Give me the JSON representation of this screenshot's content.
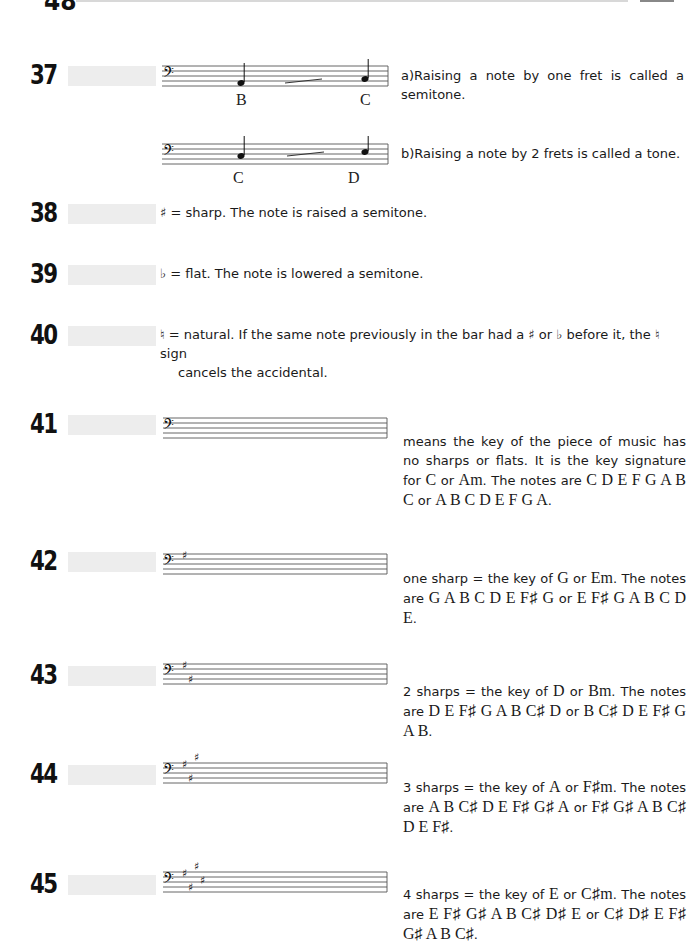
{
  "header": {
    "page_number_partial": "48"
  },
  "sections": [
    {
      "number": "37",
      "examples": [
        {
          "notes": [
            "B",
            "C"
          ],
          "text": "a)Raising a note by one fret is called a semitone."
        },
        {
          "notes": [
            "C",
            "D"
          ],
          "text": "b)Raising a note by 2 frets is called a tone."
        }
      ]
    },
    {
      "number": "38",
      "symbol": "♯",
      "text": " = sharp. The note is raised a semitone."
    },
    {
      "number": "39",
      "symbol": "♭",
      "text": " = flat. The note is lowered a semitone."
    },
    {
      "number": "40",
      "symbol": "♮",
      "text_line1": " = natural. If the same note previously in the bar had a ♯ or ♭ before it, the ♮ sign",
      "text_line2": "cancels the accidental."
    },
    {
      "number": "41",
      "sharps": 0,
      "text_a": "means the key of the piece of music has no sharps or flats. It is the key signature for ",
      "key": "C",
      "text_b": " or ",
      "minor": "Am",
      "text_c": ". The notes are ",
      "notes_major": "C D E F G A B C",
      "text_d": " or ",
      "notes_minor": "A B C D E F G A",
      "text_e": "."
    },
    {
      "number": "42",
      "sharps": 1,
      "text_a": "one sharp = the key of ",
      "key": "G",
      "text_b": " or ",
      "minor": "Em",
      "text_c": ". The notes are ",
      "notes_major": "G A B C D E F♯ G",
      "text_d": " or ",
      "notes_minor": "E F♯ G A B C D E",
      "text_e": "."
    },
    {
      "number": "43",
      "sharps": 2,
      "text_a": "2 sharps = the key of ",
      "key": "D",
      "text_b": " or ",
      "minor": "Bm",
      "text_c": ". The notes are ",
      "notes_major": "D E F♯ G A B C♯ D",
      "text_d": " or ",
      "notes_minor": "B C♯ D E F♯ G A B",
      "text_e": "."
    },
    {
      "number": "44",
      "sharps": 3,
      "text_a": "3 sharps = the key of ",
      "key": "A",
      "text_b": " or ",
      "minor": "F♯m",
      "text_c": ". The notes are ",
      "notes_major": "A B C♯ D E F♯ G♯ A",
      "text_d": " or ",
      "notes_minor": "F♯ G♯ A B C♯ D E F♯",
      "text_e": "."
    },
    {
      "number": "45",
      "sharps": 4,
      "text_a": "4 sharps = the key of ",
      "key": "E",
      "text_b": " or ",
      "minor": "C♯m",
      "text_c": ". The notes are ",
      "notes_major": "E F♯ G♯ A B C♯ D♯ E",
      "text_d": " or ",
      "notes_minor": "C♯ D♯ E F♯ G♯ A B C♯",
      "text_e": "."
    }
  ]
}
